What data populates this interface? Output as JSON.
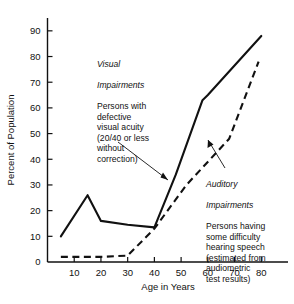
{
  "chart_data": {
    "type": "line",
    "title": "",
    "xlabel": "Age in Years",
    "ylabel": "Percent of Population",
    "xlim": [
      0,
      90
    ],
    "ylim": [
      0,
      95
    ],
    "grid": false,
    "legend_position": "inline-annotations",
    "xticks": [
      10,
      20,
      30,
      40,
      50,
      60,
      70,
      80
    ],
    "yticks": [
      0,
      10,
      20,
      30,
      40,
      50,
      60,
      70,
      80,
      90
    ],
    "series": [
      {
        "name": "Visual Impairments",
        "style": "solid",
        "color": "#111111",
        "points": [
          [
            5,
            10
          ],
          [
            15,
            26
          ],
          [
            20,
            16
          ],
          [
            30,
            14.5
          ],
          [
            40,
            13.5
          ],
          [
            48,
            34
          ],
          [
            58,
            63
          ],
          [
            60,
            65
          ],
          [
            80,
            88
          ]
        ]
      },
      {
        "name": "Auditory Impairments",
        "style": "dashed",
        "color": "#111111",
        "points": [
          [
            5,
            2
          ],
          [
            10,
            2
          ],
          [
            20,
            2
          ],
          [
            30,
            2.5
          ],
          [
            40,
            13
          ],
          [
            52,
            30
          ],
          [
            68,
            48
          ],
          [
            79,
            78
          ]
        ]
      }
    ],
    "annotations": [
      {
        "id": "visual",
        "heading": "Visual\nImpairments",
        "body": "Persons with\ndefective\nvisual acuity\n(20/40 or less\nwithout\ncorrection)",
        "arrow": "points down-right to solid curve"
      },
      {
        "id": "auditory",
        "heading": "Auditory\nImpairments",
        "body": "Persons having\nsome difficulty\nhearing speech\n(estimated from\naudiometric\ntest results)",
        "arrow": "points up-left to dashed curve"
      }
    ]
  },
  "axes": {
    "y_label": "Percent of Population",
    "x_label": "Age in Years",
    "y_ticks": [
      "90",
      "80",
      "70",
      "60",
      "50",
      "40",
      "30",
      "20",
      "10",
      "0"
    ],
    "x_ticks": [
      "10",
      "20",
      "30",
      "40",
      "50",
      "60",
      "70",
      "80"
    ]
  },
  "annotations": {
    "visual": {
      "heading_line1": "Visual",
      "heading_line2": "Impairments",
      "body": "Persons with\ndefective\nvisual acuity\n(20/40 or less\nwithout\ncorrection)"
    },
    "auditory": {
      "heading_line1": "Auditory",
      "heading_line2": "Impairments",
      "body": "Persons having\nsome difficulty\nhearing speech\n(estimated from\naudiometric\ntest results)"
    }
  }
}
